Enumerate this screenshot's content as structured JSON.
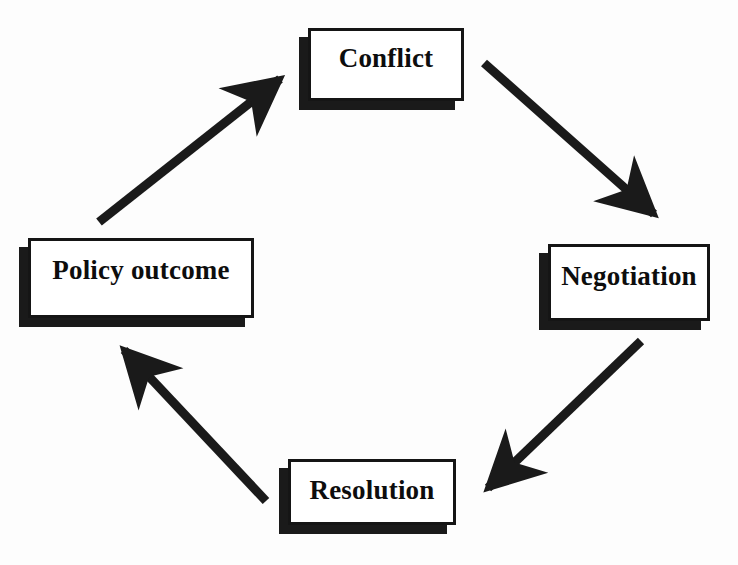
{
  "diagram": {
    "type": "cycle",
    "title": "",
    "background_color": "#fdfdfd",
    "line_color": "#1a1a1a",
    "box_fill_color": "#ffffff",
    "box_border_color": "#151515",
    "nodes": [
      {
        "id": "conflict",
        "label": "Conflict"
      },
      {
        "id": "negotiation",
        "label": "Negotiation"
      },
      {
        "id": "resolution",
        "label": "Resolution"
      },
      {
        "id": "policy",
        "label": "Policy outcome"
      }
    ],
    "edges": [
      {
        "id": "conflict-to-negotiation",
        "from": "Conflict",
        "to": "Negotiation",
        "style": "solid-thick-arrow"
      },
      {
        "id": "negotiation-to-resolution",
        "from": "Negotiation",
        "to": "Resolution",
        "style": "solid-thick-arrow"
      },
      {
        "id": "resolution-to-policy",
        "from": "Resolution",
        "to": "Policy outcome",
        "style": "solid-thick-arrow"
      },
      {
        "id": "policy-to-conflict",
        "from": "Policy outcome",
        "to": "Conflict",
        "style": "solid-thick-arrow"
      }
    ]
  }
}
